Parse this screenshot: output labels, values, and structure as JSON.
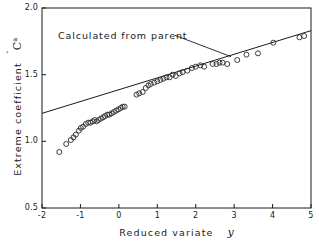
{
  "chart_data": {
    "type": "scatter",
    "title": "",
    "xlabel": "Reduced variate",
    "xlabel_symbol": "y",
    "ylabel": "Extreme coefficient",
    "ylabel_symbol": "C",
    "ylabel_symbol_sup": "a",
    "xlim": [
      -2,
      5
    ],
    "ylim": [
      0.5,
      2.0
    ],
    "xticks": [
      -2,
      -1,
      0,
      1,
      2,
      3,
      4,
      5
    ],
    "xtick_labels": [
      "-2",
      "-1",
      "0",
      "1",
      "2",
      "3",
      "4",
      "5"
    ],
    "yticks": [
      0.5,
      1.0,
      1.5,
      2.0
    ],
    "ytick_labels": [
      "0.5",
      "1.0",
      "1.5",
      "2.0"
    ],
    "grid": false,
    "legend": false,
    "marker": "open-circle",
    "series": [
      {
        "name": "Observed extreme coefficient",
        "marker": "open-circle",
        "points": [
          [
            -1.55,
            0.92
          ],
          [
            -1.37,
            0.98
          ],
          [
            -1.25,
            1.01
          ],
          [
            -1.18,
            1.03
          ],
          [
            -1.12,
            1.05
          ],
          [
            -1.04,
            1.08
          ],
          [
            -0.99,
            1.1
          ],
          [
            -0.93,
            1.11
          ],
          [
            -0.86,
            1.13
          ],
          [
            -0.8,
            1.14
          ],
          [
            -0.74,
            1.14
          ],
          [
            -0.68,
            1.15
          ],
          [
            -0.63,
            1.16
          ],
          [
            -0.58,
            1.15
          ],
          [
            -0.53,
            1.16
          ],
          [
            -0.47,
            1.17
          ],
          [
            -0.41,
            1.18
          ],
          [
            -0.36,
            1.19
          ],
          [
            -0.3,
            1.2
          ],
          [
            -0.25,
            1.2
          ],
          [
            -0.19,
            1.21
          ],
          [
            -0.13,
            1.22
          ],
          [
            -0.07,
            1.23
          ],
          [
            -0.01,
            1.24
          ],
          [
            0.05,
            1.25
          ],
          [
            0.1,
            1.26
          ],
          [
            0.15,
            1.26
          ],
          [
            0.46,
            1.35
          ],
          [
            0.53,
            1.36
          ],
          [
            0.62,
            1.37
          ],
          [
            0.7,
            1.4
          ],
          [
            0.77,
            1.42
          ],
          [
            0.83,
            1.43
          ],
          [
            0.92,
            1.44
          ],
          [
            1.0,
            1.45
          ],
          [
            1.08,
            1.46
          ],
          [
            1.16,
            1.47
          ],
          [
            1.24,
            1.48
          ],
          [
            1.32,
            1.48
          ],
          [
            1.4,
            1.5
          ],
          [
            1.48,
            1.49
          ],
          [
            1.58,
            1.51
          ],
          [
            1.66,
            1.52
          ],
          [
            1.78,
            1.53
          ],
          [
            1.9,
            1.55
          ],
          [
            2.0,
            1.56
          ],
          [
            2.12,
            1.57
          ],
          [
            2.22,
            1.56
          ],
          [
            2.44,
            1.58
          ],
          [
            2.54,
            1.58
          ],
          [
            2.62,
            1.59
          ],
          [
            2.7,
            1.59
          ],
          [
            2.82,
            1.58
          ],
          [
            3.08,
            1.61
          ],
          [
            3.32,
            1.65
          ],
          [
            3.62,
            1.66
          ],
          [
            4.02,
            1.74
          ],
          [
            4.7,
            1.78
          ],
          [
            4.82,
            1.79
          ]
        ]
      }
    ],
    "reference_line": {
      "name": "Calculated from parent",
      "x": [
        -2,
        5
      ],
      "y": [
        1.21,
        1.83
      ]
    },
    "annotations": [
      {
        "text": "Calculated from parent",
        "text_x": -1.58,
        "text_y": 1.845,
        "leader_from_x": 1.46,
        "leader_from_y": 1.795,
        "leader_to_x": 2.92,
        "leader_to_y": 1.635
      }
    ]
  },
  "colors": {
    "axis": "#1a1a1a",
    "marker": "#2a2a2a",
    "line": "#1a1a1a",
    "background": "#ffffff"
  }
}
